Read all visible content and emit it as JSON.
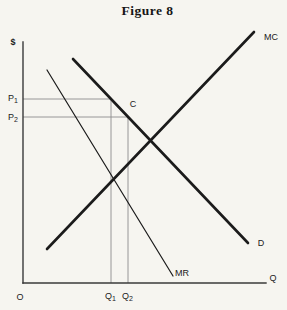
{
  "figure": {
    "title": "Figure 8",
    "colors": {
      "background": "#f6f5f0",
      "curve_ink": "#1b1b1b",
      "axis_ink": "#3a3a3a",
      "guide_gray": "#8c8c8c",
      "text_ink": "#1b1b1b"
    },
    "axes": {
      "y_axis_label": "$",
      "x_axis_label": "Q",
      "origin_label": "O",
      "y_axis": {
        "x1": 23,
        "y1": 42,
        "x2": 23,
        "y2": 283
      },
      "x_axis": {
        "x1": 23,
        "y1": 283,
        "x2": 266,
        "y2": 283
      }
    },
    "curves": [
      {
        "name": "marginal-cost-curve",
        "label": "MC",
        "x1": 47,
        "y1": 249,
        "x2": 254,
        "y2": 32,
        "width": 2.6,
        "label_x": 271,
        "label_y": 40
      },
      {
        "name": "demand-curve",
        "label": "D",
        "x1": 73,
        "y1": 59,
        "x2": 248,
        "y2": 243,
        "width": 2.6,
        "label_x": 261,
        "label_y": 246
      },
      {
        "name": "marginal-revenue-curve",
        "label": "MR",
        "x1": 47,
        "y1": 70,
        "x2": 173,
        "y2": 276,
        "width": 1.2,
        "label_x": 182,
        "label_y": 276
      }
    ],
    "guides": [
      {
        "name": "price-p1-guide",
        "x1": 23,
        "y1": 99,
        "x2": 111,
        "y2": 99
      },
      {
        "name": "price-p2-guide",
        "x1": 23,
        "y1": 117,
        "x2": 128,
        "y2": 117
      },
      {
        "name": "quantity-q1-guide",
        "x1": 111,
        "y1": 99,
        "x2": 111,
        "y2": 283
      },
      {
        "name": "quantity-q2-guide",
        "x1": 128,
        "y1": 117,
        "x2": 128,
        "y2": 283
      }
    ],
    "labels": [
      {
        "name": "y-axis-label",
        "text": "$",
        "x": 13,
        "y": 45,
        "anchor": "middle",
        "bold": true
      },
      {
        "name": "origin-label",
        "text": "O",
        "x": 20,
        "y": 300,
        "anchor": "middle"
      },
      {
        "name": "x-axis-label",
        "text": "Q",
        "x": 273,
        "y": 281,
        "anchor": "middle"
      },
      {
        "name": "price-p1-label",
        "base": "P",
        "sub": "1",
        "x": 8,
        "y": 101,
        "anchor": "start"
      },
      {
        "name": "price-p2-label",
        "base": "P",
        "sub": "2",
        "x": 8,
        "y": 120,
        "anchor": "start"
      },
      {
        "name": "quantity-q1-label",
        "base": "Q",
        "sub": "1",
        "x": 105,
        "y": 299,
        "anchor": "start"
      },
      {
        "name": "quantity-q2-label",
        "base": "Q",
        "sub": "2",
        "x": 122,
        "y": 299,
        "anchor": "start"
      },
      {
        "name": "point-c-label",
        "text": "C",
        "x": 133,
        "y": 107,
        "anchor": "middle"
      }
    ]
  }
}
